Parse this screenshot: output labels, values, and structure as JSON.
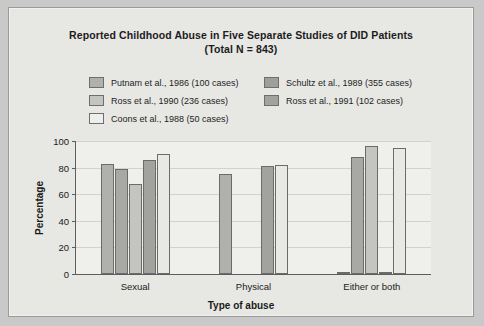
{
  "chart_data": {
    "type": "bar",
    "title": "Reported Childhood Abuse in Five Separate Studies of DID Patients",
    "subtitle": "(Total N = 843)",
    "xlabel": "Type of abuse",
    "ylabel": "Percentage",
    "categories": [
      "Sexual",
      "Physical",
      "Either or both"
    ],
    "ylim": [
      0,
      100
    ],
    "yticks": [
      0,
      20,
      40,
      60,
      80,
      100
    ],
    "ytick_labels": [
      "0",
      "20",
      "40",
      "60",
      "80",
      "100"
    ],
    "grid": true,
    "legend_position": "top",
    "series": [
      {
        "name": "Putnam et al., 1986 (100 cases)",
        "color": "#b0b0ad",
        "values": [
          83,
          75,
          1
        ]
      },
      {
        "name": "Schultz et al., 1989 (355 cases)",
        "color": "#a8a8a5",
        "values": [
          79,
          0,
          88
        ]
      },
      {
        "name": "Ross et al., 1990 (236 cases)",
        "color": "#c4c4c1",
        "values": [
          68,
          0,
          96
        ]
      },
      {
        "name": "Ross et al., 1991 (102 cases)",
        "color": "#a2a29f",
        "values": [
          86,
          81,
          1
        ]
      },
      {
        "name": "Coons et al., 1988 (50 cases)",
        "color": "#e8e8e5",
        "values": [
          90,
          82,
          95
        ]
      }
    ]
  },
  "legend": {
    "items": [
      {
        "label": "Putnam et al., 1986 (100 cases)",
        "color": "#b0b0ad"
      },
      {
        "label": "Schultz et al., 1989 (355 cases)",
        "color": "#9e9e9b"
      },
      {
        "label": "Ross et al., 1990 (236 cases)",
        "color": "#c4c4c1"
      },
      {
        "label": "Ross et al., 1991 (102 cases)",
        "color": "#a2a29f"
      },
      {
        "label": "Coons et al., 1988 (50 cases)",
        "color": "#eeeeec"
      }
    ]
  },
  "colors": {
    "figure_background": "#e7e7e4",
    "plot_background": "#efefec",
    "axis": "#5d5d5d",
    "gridline": "#d2d2cd",
    "page_background": "#c9c9c9"
  }
}
